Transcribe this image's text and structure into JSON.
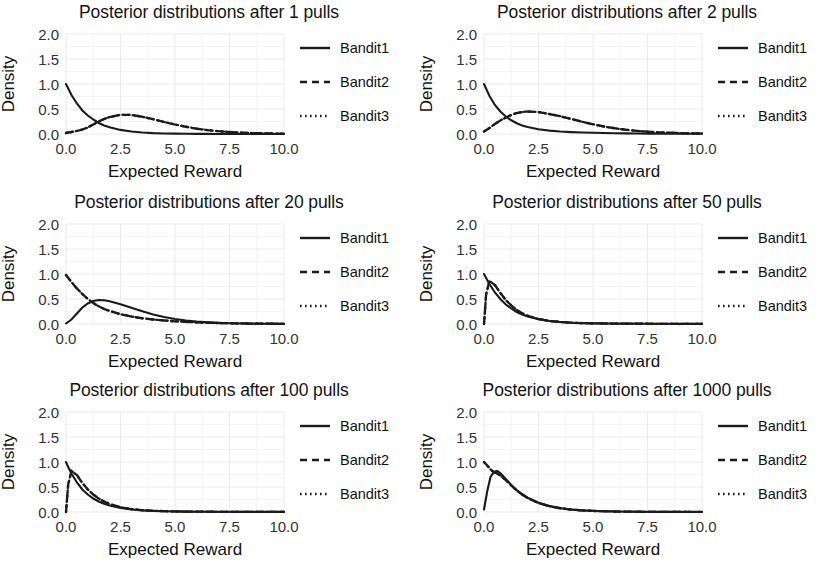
{
  "figure": {
    "panel_title_prefix": "Posterior distributions after",
    "panel_title_suffix": "pulls",
    "xlabel": "Expected Reward",
    "ylabel": "Density",
    "legend": [
      "Bandit1",
      "Bandit2",
      "Bandit3"
    ],
    "xticks": [
      "0.0",
      "2.5",
      "5.0",
      "7.5",
      "10.0"
    ],
    "yticks": [
      "0.0",
      "0.5",
      "1.0",
      "1.5",
      "2.0"
    ]
  },
  "titles": {
    "p1": "Posterior distributions after 1 pulls",
    "p2": "Posterior distributions after 2 pulls",
    "p3": "Posterior distributions after 20 pulls",
    "p4": "Posterior distributions after 50 pulls",
    "p5": "Posterior distributions after 100 pulls",
    "p6": "Posterior distributions after 1000 pulls"
  },
  "chart_data": [
    {
      "type": "line",
      "title": "Posterior distributions after 1 pulls",
      "xlabel": "Expected Reward",
      "ylabel": "Density",
      "xlim": [
        0,
        10
      ],
      "ylim": [
        0,
        2.0
      ],
      "xticks": [
        0.0,
        2.5,
        5.0,
        7.5,
        10.0
      ],
      "yticks": [
        0.0,
        0.5,
        1.0,
        1.5,
        2.0
      ],
      "grid": true,
      "legend_position": "right",
      "x": [
        0.0,
        0.25,
        0.5,
        0.75,
        1.0,
        1.25,
        1.5,
        1.75,
        2.0,
        2.5,
        3.0,
        3.5,
        4.0,
        4.5,
        5.0,
        5.5,
        6.0,
        6.5,
        7.0,
        7.5,
        8.0,
        8.5,
        9.0,
        9.5,
        10.0
      ],
      "series": [
        {
          "name": "Bandit1",
          "style": "solid",
          "values": [
            1.0,
            0.78,
            0.61,
            0.47,
            0.37,
            0.29,
            0.22,
            0.17,
            0.135,
            0.082,
            0.05,
            0.03,
            0.018,
            0.011,
            0.0067,
            0.0041,
            0.0025,
            0.0015,
            0.0009,
            0.00055,
            0.00034,
            0.0002,
            0.00012,
            8e-05,
            5e-05
          ]
        },
        {
          "name": "Bandit2",
          "style": "dashed",
          "values": [
            0.02,
            0.04,
            0.06,
            0.09,
            0.13,
            0.19,
            0.25,
            0.3,
            0.34,
            0.385,
            0.38,
            0.345,
            0.295,
            0.24,
            0.19,
            0.145,
            0.105,
            0.078,
            0.056,
            0.04,
            0.028,
            0.02,
            0.014,
            0.01,
            0.007
          ]
        },
        {
          "name": "Bandit3",
          "style": "dotted",
          "values": [
            0.02,
            0.04,
            0.06,
            0.09,
            0.13,
            0.19,
            0.25,
            0.3,
            0.34,
            0.385,
            0.38,
            0.345,
            0.295,
            0.24,
            0.19,
            0.145,
            0.105,
            0.078,
            0.056,
            0.04,
            0.028,
            0.02,
            0.014,
            0.01,
            0.007
          ]
        }
      ]
    },
    {
      "type": "line",
      "title": "Posterior distributions after 2 pulls",
      "xlabel": "Expected Reward",
      "ylabel": "Density",
      "xlim": [
        0,
        10
      ],
      "ylim": [
        0,
        2.0
      ],
      "xticks": [
        0.0,
        2.5,
        5.0,
        7.5,
        10.0
      ],
      "yticks": [
        0.0,
        0.5,
        1.0,
        1.5,
        2.0
      ],
      "grid": true,
      "legend_position": "right",
      "x": [
        0.0,
        0.25,
        0.5,
        0.75,
        1.0,
        1.25,
        1.5,
        1.75,
        2.0,
        2.5,
        3.0,
        3.5,
        4.0,
        4.5,
        5.0,
        5.5,
        6.0,
        6.5,
        7.0,
        7.5,
        8.0,
        8.5,
        9.0,
        9.5,
        10.0
      ],
      "series": [
        {
          "name": "Bandit1",
          "style": "solid",
          "values": [
            1.0,
            0.76,
            0.58,
            0.45,
            0.35,
            0.275,
            0.215,
            0.17,
            0.14,
            0.095,
            0.068,
            0.05,
            0.038,
            0.03,
            0.024,
            0.019,
            0.015,
            0.012,
            0.01,
            0.008,
            0.007,
            0.006,
            0.005,
            0.004,
            0.004
          ]
        },
        {
          "name": "Bandit2",
          "style": "dashed",
          "values": [
            0.05,
            0.12,
            0.2,
            0.27,
            0.33,
            0.38,
            0.42,
            0.44,
            0.45,
            0.44,
            0.4,
            0.355,
            0.3,
            0.245,
            0.195,
            0.15,
            0.115,
            0.085,
            0.063,
            0.046,
            0.034,
            0.025,
            0.018,
            0.013,
            0.01
          ]
        },
        {
          "name": "Bandit3",
          "style": "dotted",
          "values": [
            0.05,
            0.12,
            0.2,
            0.27,
            0.33,
            0.38,
            0.42,
            0.44,
            0.45,
            0.44,
            0.4,
            0.355,
            0.3,
            0.245,
            0.195,
            0.15,
            0.115,
            0.085,
            0.063,
            0.046,
            0.034,
            0.025,
            0.018,
            0.013,
            0.01
          ]
        }
      ]
    },
    {
      "type": "line",
      "title": "Posterior distributions after 20 pulls",
      "xlabel": "Expected Reward",
      "ylabel": "Density",
      "xlim": [
        0,
        10
      ],
      "ylim": [
        0,
        2.0
      ],
      "xticks": [
        0.0,
        2.5,
        5.0,
        7.5,
        10.0
      ],
      "yticks": [
        0.0,
        0.5,
        1.0,
        1.5,
        2.0
      ],
      "grid": true,
      "legend_position": "right",
      "x": [
        0.0,
        0.25,
        0.5,
        0.75,
        1.0,
        1.25,
        1.5,
        1.75,
        2.0,
        2.5,
        3.0,
        3.5,
        4.0,
        4.5,
        5.0,
        5.5,
        6.0,
        6.5,
        7.0,
        7.5,
        8.0,
        8.5,
        9.0,
        9.5,
        10.0
      ],
      "series": [
        {
          "name": "Bandit1",
          "style": "solid",
          "values": [
            0.01,
            0.09,
            0.21,
            0.33,
            0.41,
            0.46,
            0.48,
            0.475,
            0.455,
            0.395,
            0.325,
            0.255,
            0.19,
            0.14,
            0.1,
            0.07,
            0.048,
            0.033,
            0.022,
            0.015,
            0.01,
            0.007,
            0.005,
            0.003,
            0.002
          ]
        },
        {
          "name": "Bandit2",
          "style": "dashed",
          "values": [
            0.98,
            0.84,
            0.71,
            0.6,
            0.5,
            0.42,
            0.355,
            0.3,
            0.26,
            0.195,
            0.15,
            0.115,
            0.09,
            0.07,
            0.054,
            0.042,
            0.032,
            0.025,
            0.019,
            0.015,
            0.011,
            0.009,
            0.007,
            0.005,
            0.004
          ]
        },
        {
          "name": "Bandit3",
          "style": "dotted",
          "values": [
            0.98,
            0.84,
            0.71,
            0.6,
            0.5,
            0.42,
            0.355,
            0.3,
            0.26,
            0.195,
            0.15,
            0.115,
            0.09,
            0.07,
            0.054,
            0.042,
            0.032,
            0.025,
            0.019,
            0.015,
            0.011,
            0.009,
            0.007,
            0.005,
            0.004
          ]
        }
      ]
    },
    {
      "type": "line",
      "title": "Posterior distributions after 50 pulls",
      "xlabel": "Expected Reward",
      "ylabel": "Density",
      "xlim": [
        0,
        10
      ],
      "ylim": [
        0,
        2.0
      ],
      "xticks": [
        0.0,
        2.5,
        5.0,
        7.5,
        10.0
      ],
      "yticks": [
        0.0,
        0.5,
        1.0,
        1.5,
        2.0
      ],
      "grid": true,
      "legend_position": "right",
      "x": [
        0.0,
        0.1,
        0.25,
        0.5,
        0.75,
        1.0,
        1.25,
        1.5,
        1.75,
        2.0,
        2.5,
        3.0,
        3.5,
        4.0,
        4.5,
        5.0,
        5.5,
        6.0,
        7.0,
        8.0,
        9.0,
        10.0
      ],
      "series": [
        {
          "name": "Bandit1",
          "style": "solid",
          "values": [
            1.0,
            0.92,
            0.8,
            0.63,
            0.5,
            0.39,
            0.31,
            0.24,
            0.19,
            0.15,
            0.095,
            0.06,
            0.039,
            0.026,
            0.018,
            0.013,
            0.01,
            0.008,
            0.005,
            0.004,
            0.003,
            0.002
          ]
        },
        {
          "name": "Bandit2",
          "style": "dashed",
          "values": [
            0.0,
            0.6,
            0.86,
            0.78,
            0.62,
            0.48,
            0.37,
            0.28,
            0.215,
            0.165,
            0.1,
            0.062,
            0.04,
            0.027,
            0.019,
            0.014,
            0.01,
            0.008,
            0.005,
            0.004,
            0.003,
            0.002
          ]
        },
        {
          "name": "Bandit3",
          "style": "dotted",
          "values": [
            0.0,
            0.6,
            0.86,
            0.78,
            0.62,
            0.48,
            0.37,
            0.28,
            0.215,
            0.165,
            0.1,
            0.062,
            0.04,
            0.027,
            0.019,
            0.014,
            0.01,
            0.008,
            0.005,
            0.004,
            0.003,
            0.002
          ]
        }
      ]
    },
    {
      "type": "line",
      "title": "Posterior distributions after 100 pulls",
      "xlabel": "Expected Reward",
      "ylabel": "Density",
      "xlim": [
        0,
        10
      ],
      "ylim": [
        0,
        2.0
      ],
      "xticks": [
        0.0,
        2.5,
        5.0,
        7.5,
        10.0
      ],
      "yticks": [
        0.0,
        0.5,
        1.0,
        1.5,
        2.0
      ],
      "grid": true,
      "legend_position": "right",
      "x": [
        0.0,
        0.1,
        0.25,
        0.5,
        0.75,
        1.0,
        1.25,
        1.5,
        1.75,
        2.0,
        2.5,
        3.0,
        3.5,
        4.0,
        4.5,
        5.0,
        5.5,
        6.0,
        7.0,
        8.0,
        9.0,
        10.0
      ],
      "series": [
        {
          "name": "Bandit1",
          "style": "solid",
          "values": [
            1.0,
            0.9,
            0.77,
            0.59,
            0.45,
            0.35,
            0.27,
            0.21,
            0.165,
            0.13,
            0.08,
            0.05,
            0.032,
            0.021,
            0.015,
            0.011,
            0.008,
            0.006,
            0.004,
            0.003,
            0.002,
            0.002
          ]
        },
        {
          "name": "Bandit2",
          "style": "dashed",
          "values": [
            0.0,
            0.55,
            0.82,
            0.74,
            0.58,
            0.45,
            0.35,
            0.27,
            0.21,
            0.16,
            0.095,
            0.058,
            0.036,
            0.024,
            0.017,
            0.012,
            0.009,
            0.007,
            0.004,
            0.003,
            0.002,
            0.002
          ]
        },
        {
          "name": "Bandit3",
          "style": "dotted",
          "values": [
            0.0,
            0.55,
            0.82,
            0.74,
            0.58,
            0.45,
            0.35,
            0.27,
            0.21,
            0.16,
            0.095,
            0.058,
            0.036,
            0.024,
            0.017,
            0.012,
            0.009,
            0.007,
            0.004,
            0.003,
            0.002,
            0.002
          ]
        }
      ]
    },
    {
      "type": "line",
      "title": "Posterior distributions after 1000 pulls",
      "xlabel": "Expected Reward",
      "ylabel": "Density",
      "xlim": [
        0,
        10
      ],
      "ylim": [
        0,
        2.0
      ],
      "xticks": [
        0.0,
        2.5,
        5.0,
        7.5,
        10.0
      ],
      "yticks": [
        0.0,
        0.5,
        1.0,
        1.5,
        2.0
      ],
      "grid": true,
      "legend_position": "right",
      "x": [
        0.0,
        0.15,
        0.3,
        0.45,
        0.6,
        0.75,
        1.0,
        1.25,
        1.5,
        1.75,
        2.0,
        2.5,
        3.0,
        3.5,
        4.0,
        4.5,
        5.0,
        6.0,
        7.0,
        8.0,
        9.0,
        10.0
      ],
      "series": [
        {
          "name": "Bandit1",
          "style": "solid",
          "values": [
            0.05,
            0.42,
            0.7,
            0.8,
            0.82,
            0.78,
            0.66,
            0.54,
            0.44,
            0.355,
            0.285,
            0.185,
            0.12,
            0.077,
            0.05,
            0.033,
            0.022,
            0.01,
            0.005,
            0.003,
            0.002,
            0.001
          ]
        },
        {
          "name": "Bandit2",
          "style": "dashed",
          "values": [
            1.0,
            0.93,
            0.85,
            0.8,
            0.77,
            0.73,
            0.64,
            0.53,
            0.43,
            0.35,
            0.28,
            0.18,
            0.115,
            0.074,
            0.048,
            0.032,
            0.021,
            0.01,
            0.005,
            0.003,
            0.002,
            0.001
          ]
        },
        {
          "name": "Bandit3",
          "style": "dotted",
          "values": [
            1.0,
            0.93,
            0.85,
            0.8,
            0.77,
            0.73,
            0.64,
            0.53,
            0.43,
            0.35,
            0.28,
            0.18,
            0.115,
            0.074,
            0.048,
            0.032,
            0.021,
            0.01,
            0.005,
            0.003,
            0.002,
            0.001
          ]
        }
      ]
    }
  ]
}
